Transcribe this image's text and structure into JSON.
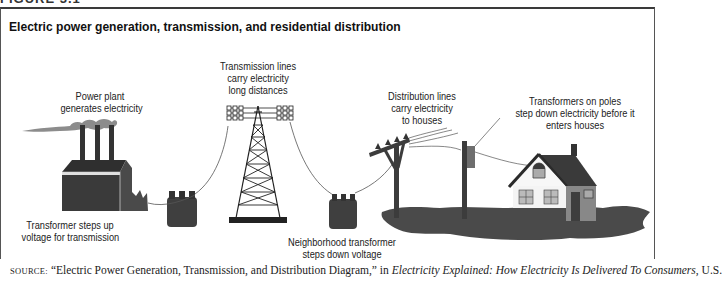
{
  "figure": {
    "header_fragment": "FIGURE 3.1",
    "title": "Electric power generation, transmission, and residential distribution"
  },
  "labels": {
    "power_plant": [
      "Power plant",
      "generates electricity"
    ],
    "step_up_transformer": [
      "Transformer steps up",
      "voltage for transmission"
    ],
    "transmission_lines": [
      "Transmission lines",
      "carry electricity",
      "long distances"
    ],
    "neighborhood_transformer": [
      "Neighborhood transformer",
      "steps down voltage"
    ],
    "distribution_lines": [
      "Distribution lines",
      "carry electricity",
      "to houses"
    ],
    "pole_transformers": [
      "Transformers on poles",
      "step down electricity before it",
      "enters houses"
    ]
  },
  "source": {
    "prefix": "SOURCE:",
    "quote": " “Electric Power Generation, Transmission, and Distribution Diagram,” in ",
    "work": "Electricity Explained: How Electricity Is Delivered To Consumers",
    "suffix": ", U.S."
  },
  "colors": {
    "dark_fill": "#3c3c3c",
    "mid_fill": "#6e6e6e",
    "light_fill": "#a8a8a8",
    "smoke": "#8c8c8c",
    "line": "#555555"
  }
}
